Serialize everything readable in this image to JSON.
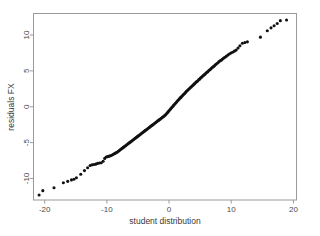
{
  "chart_data": {
    "type": "scatter",
    "title": "",
    "subtitle": "",
    "xlabel": "student distribution",
    "ylabel": "residuals FX",
    "xlim": [
      -21.8,
      20.5
    ],
    "ylim": [
      -13.0,
      13.0
    ],
    "xticks": [
      -20,
      -10,
      0,
      10,
      20
    ],
    "xtick_labels": [
      "-20",
      "-10",
      "0",
      "10",
      "20"
    ],
    "yticks": [
      -10,
      -5,
      0,
      5,
      10
    ],
    "ytick_labels": [
      "-10",
      "-5",
      "0",
      "5",
      "10"
    ],
    "grid": false,
    "legend": null,
    "legend_position": "none",
    "marker": "filled-circle",
    "marker_color": "#111111",
    "marker_size_px": 1.55,
    "frame_color": "#9a9a9a",
    "background_color": "#ffffff",
    "series": [
      {
        "name": "residuals FX vs student distribution",
        "x": [
          -20.9,
          -20.3,
          -18.5,
          -17.0,
          -16.3,
          -15.7,
          -15.3,
          -14.9,
          -14.2,
          -13.6,
          -13.1,
          -12.7,
          -12.4,
          -12.1,
          -11.8,
          -11.5,
          -11.2,
          -10.9,
          -10.6,
          -10.35,
          -10.1,
          -9.9,
          -9.7,
          -9.5,
          -9.3,
          -9.1,
          -8.9,
          -8.7,
          -8.5,
          -8.3,
          -8.15,
          -8.0,
          -7.85,
          -7.7,
          -7.55,
          -7.4,
          -7.25,
          -7.1,
          -6.95,
          -6.8,
          -6.65,
          -6.5,
          -6.35,
          -6.2,
          -6.05,
          -5.9,
          -5.75,
          -5.6,
          -5.45,
          -5.3,
          -5.15,
          -5.0,
          -4.85,
          -4.7,
          -4.55,
          -4.4,
          -4.25,
          -4.1,
          -3.95,
          -3.8,
          -3.65,
          -3.5,
          -3.35,
          -3.2,
          -3.05,
          -2.9,
          -2.75,
          -2.6,
          -2.45,
          -2.3,
          -2.15,
          -2.0,
          -1.85,
          -1.7,
          -1.55,
          -1.4,
          -1.25,
          -1.1,
          -0.95,
          -0.8,
          -0.65,
          -0.5,
          -0.35,
          -0.2,
          -0.05,
          0.1,
          0.25,
          0.4,
          0.55,
          0.7,
          0.85,
          1.0,
          1.15,
          1.3,
          1.45,
          1.6,
          1.75,
          1.9,
          2.05,
          2.2,
          2.35,
          2.5,
          2.65,
          2.8,
          2.95,
          3.1,
          3.25,
          3.4,
          3.55,
          3.7,
          3.85,
          4.0,
          4.15,
          4.3,
          4.45,
          4.6,
          4.75,
          4.9,
          5.05,
          5.2,
          5.35,
          5.5,
          5.65,
          5.8,
          5.95,
          6.1,
          6.25,
          6.4,
          6.55,
          6.7,
          6.85,
          7.0,
          7.15,
          7.3,
          7.45,
          7.6,
          7.8,
          8.0,
          8.2,
          8.4,
          8.6,
          8.8,
          9.0,
          9.2,
          9.45,
          9.7,
          9.95,
          10.2,
          10.5,
          10.8,
          11.1,
          11.4,
          11.8,
          12.2,
          12.6,
          14.7,
          15.8,
          16.4,
          16.9,
          17.4,
          17.9,
          18.9
        ],
        "y": [
          -12.3,
          -11.7,
          -11.3,
          -10.6,
          -10.4,
          -10.2,
          -10.1,
          -9.9,
          -9.4,
          -8.9,
          -8.5,
          -8.2,
          -8.1,
          -8.05,
          -8.0,
          -7.9,
          -7.85,
          -7.8,
          -7.6,
          -7.2,
          -7.0,
          -6.95,
          -6.9,
          -6.85,
          -6.8,
          -6.7,
          -6.6,
          -6.5,
          -6.4,
          -6.3,
          -6.2,
          -6.1,
          -6.0,
          -5.9,
          -5.8,
          -5.7,
          -5.6,
          -5.5,
          -5.4,
          -5.3,
          -5.2,
          -5.1,
          -5.0,
          -4.9,
          -4.8,
          -4.7,
          -4.6,
          -4.5,
          -4.4,
          -4.3,
          -4.2,
          -4.1,
          -4.0,
          -3.9,
          -3.8,
          -3.7,
          -3.6,
          -3.5,
          -3.4,
          -3.3,
          -3.2,
          -3.1,
          -3.0,
          -2.9,
          -2.8,
          -2.7,
          -2.6,
          -2.5,
          -2.4,
          -2.3,
          -2.2,
          -2.1,
          -2.0,
          -1.9,
          -1.8,
          -1.7,
          -1.6,
          -1.5,
          -1.4,
          -1.3,
          -1.2,
          -1.05,
          -0.9,
          -0.75,
          -0.6,
          -0.45,
          -0.3,
          -0.15,
          0.0,
          0.15,
          0.3,
          0.45,
          0.6,
          0.75,
          0.9,
          1.05,
          1.2,
          1.3,
          1.45,
          1.6,
          1.75,
          1.85,
          2.0,
          2.15,
          2.25,
          2.4,
          2.5,
          2.65,
          2.75,
          2.9,
          3.0,
          3.15,
          3.25,
          3.4,
          3.5,
          3.6,
          3.75,
          3.85,
          4.0,
          4.1,
          4.2,
          4.35,
          4.45,
          4.55,
          4.7,
          4.8,
          4.9,
          5.05,
          5.15,
          5.25,
          5.4,
          5.5,
          5.6,
          5.7,
          5.85,
          5.95,
          6.1,
          6.25,
          6.4,
          6.5,
          6.65,
          6.8,
          6.9,
          7.05,
          7.2,
          7.35,
          7.5,
          7.6,
          7.75,
          7.9,
          8.2,
          8.5,
          8.85,
          8.95,
          9.05,
          9.7,
          10.6,
          11.0,
          11.3,
          11.6,
          12.0,
          12.1
        ]
      }
    ]
  }
}
